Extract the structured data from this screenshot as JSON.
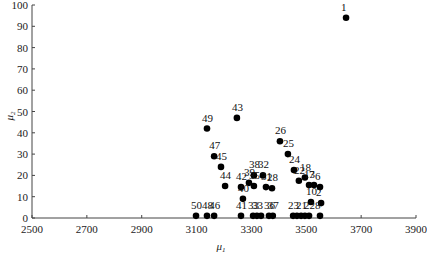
{
  "chart_data": {
    "type": "scatter",
    "title": "",
    "xlabel": "μ1",
    "ylabel": "μ2",
    "xlim": [
      2500,
      3900
    ],
    "ylim": [
      0,
      100
    ],
    "xticks": [
      2500,
      2700,
      2900,
      3100,
      3300,
      3500,
      3700,
      3900
    ],
    "yticks": [
      0,
      10,
      20,
      30,
      40,
      50,
      60,
      70,
      80,
      90,
      100
    ],
    "grid": false,
    "legend": null,
    "points": [
      {
        "label": "1",
        "x": 3645,
        "y": 94
      },
      {
        "label": "43",
        "x": 3247,
        "y": 47
      },
      {
        "label": "49",
        "x": 3138,
        "y": 42
      },
      {
        "label": "26",
        "x": 3404,
        "y": 36
      },
      {
        "label": "25",
        "x": 3433,
        "y": 30
      },
      {
        "label": "47",
        "x": 3164,
        "y": 29
      },
      {
        "label": "45",
        "x": 3189,
        "y": 24
      },
      {
        "label": "24",
        "x": 3455,
        "y": 22.5
      },
      {
        "label": "18",
        "x": 3495,
        "y": 19
      },
      {
        "label": "22",
        "x": 3473,
        "y": 17.5
      },
      {
        "label": "38",
        "x": 3309,
        "y": 20
      },
      {
        "label": "32",
        "x": 3342,
        "y": 20
      },
      {
        "label": "39",
        "x": 3291,
        "y": 16.5
      },
      {
        "label": "13",
        "x": 3510,
        "y": 15.5
      },
      {
        "label": "7",
        "x": 3528,
        "y": 15.5
      },
      {
        "label": "6",
        "x": 3550,
        "y": 14.5
      },
      {
        "label": "44",
        "x": 3204,
        "y": 15
      },
      {
        "label": "42",
        "x": 3262,
        "y": 14.5
      },
      {
        "label": "35",
        "x": 3309,
        "y": 15
      },
      {
        "label": "31",
        "x": 3353,
        "y": 14.5
      },
      {
        "label": "28",
        "x": 3375,
        "y": 14
      },
      {
        "label": "40",
        "x": 3269,
        "y": 9
      },
      {
        "label": "10",
        "x": 3517,
        "y": 7.5
      },
      {
        "label": "2",
        "x": 3554,
        "y": 7
      },
      {
        "label": "50",
        "x": 3098,
        "y": 1
      },
      {
        "label": "48",
        "x": 3138,
        "y": 1
      },
      {
        "label": "46",
        "x": 3164,
        "y": 1
      },
      {
        "label": "41",
        "x": 3262,
        "y": 1
      },
      {
        "label": "33",
        "x": 3306,
        "y": 1
      },
      {
        "label": "33",
        "x": 3320,
        "y": 1
      },
      {
        "label": "",
        "x": 3335,
        "y": 1
      },
      {
        "label": "36",
        "x": 3364,
        "y": 1
      },
      {
        "label": "37",
        "x": 3378,
        "y": 1
      },
      {
        "label": "23",
        "x": 3452,
        "y": 1
      },
      {
        "label": "",
        "x": 3466,
        "y": 1
      },
      {
        "label": "21",
        "x": 3481,
        "y": 1
      },
      {
        "label": "",
        "x": 3495,
        "y": 1
      },
      {
        "label": "22",
        "x": 3510,
        "y": 1
      },
      {
        "label": "8",
        "x": 3550,
        "y": 1
      }
    ]
  },
  "axes": {
    "x_title_main": "μ",
    "x_title_sub": "1",
    "y_title_main": "μ",
    "y_title_sub": "2"
  }
}
